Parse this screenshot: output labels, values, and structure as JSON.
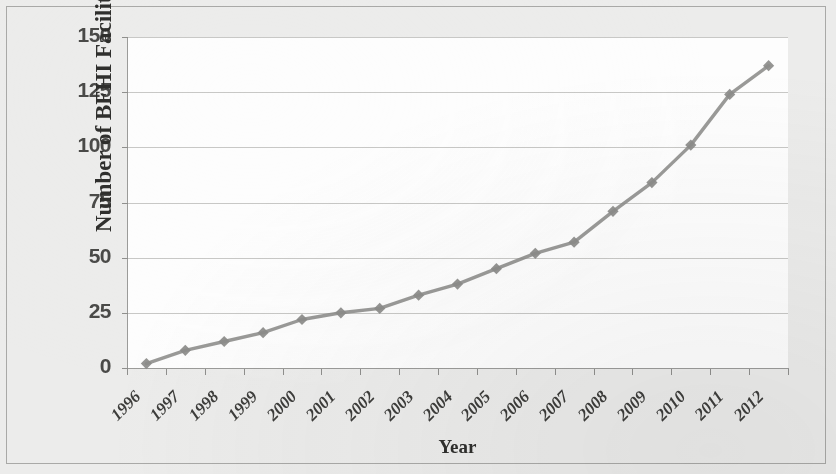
{
  "chart_data": {
    "type": "line",
    "title": "",
    "subtitle": "",
    "xlabel": "Year",
    "ylabel": "Number of BFHI Facilities",
    "categories": [
      "1996",
      "1997",
      "1998",
      "1999",
      "2000",
      "2001",
      "2002",
      "2003",
      "2004",
      "2005",
      "2006",
      "2007",
      "2008",
      "2009",
      "2010",
      "2011",
      "2012"
    ],
    "values": [
      2,
      8,
      12,
      16,
      22,
      25,
      27,
      33,
      38,
      45,
      52,
      57,
      71,
      84,
      101,
      124,
      137
    ],
    "series": [
      {
        "name": "Number of BFHI Facilities",
        "values": [
          2,
          8,
          12,
          16,
          22,
          25,
          27,
          33,
          38,
          45,
          52,
          57,
          71,
          84,
          101,
          124,
          137
        ]
      }
    ],
    "ylim": [
      0,
      150
    ],
    "yticks": [
      0,
      25,
      50,
      75,
      100,
      125,
      150
    ],
    "ytick_labels": [
      "0",
      "25",
      "50",
      "75",
      "100",
      "125",
      "150"
    ],
    "grid": "horizontal",
    "legend": "none",
    "marker": "diamond",
    "line_color": "#8c8c8a",
    "marker_color": "#8c8c8a",
    "plot_background": "#fdfdfd",
    "figure_background": "#ececeb",
    "xtick_rotation": -45
  },
  "axes": {
    "y_title": "Number of BFHI Facilities",
    "x_title": "Year"
  }
}
